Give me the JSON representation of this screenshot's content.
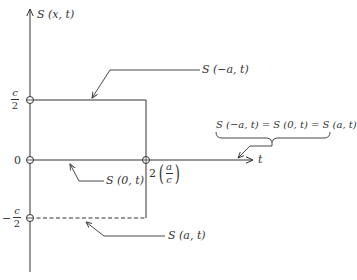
{
  "diagram": {
    "axes": {
      "y_label": "S (x, t)",
      "x_label": "t"
    },
    "levels": {
      "top": {
        "num": "c",
        "den": "2",
        "sign": ""
      },
      "zero": "0",
      "bottom": {
        "num": "c",
        "den": "2",
        "sign": "−"
      }
    },
    "t_mark": {
      "coef": "2",
      "num": "a",
      "den": "c"
    },
    "callouts": {
      "s_minus_a": "S (−a, t)",
      "s_zero": "S (0, t)",
      "s_a": "S (a, t)",
      "equality": "S (−a, t) = S (0, t) = S (a, t)"
    },
    "colors": {
      "line": "#333333",
      "background": "#ffffff"
    }
  }
}
